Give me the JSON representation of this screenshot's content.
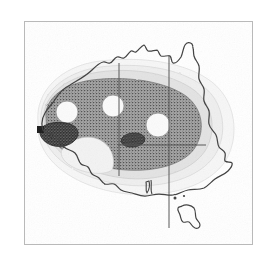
{
  "figure": {
    "title": "Distribution map of Australia",
    "frame": {
      "present": true,
      "color": "#b9b9b9",
      "x": 24,
      "y": 21,
      "w": 229,
      "h": 224
    },
    "background_color": "#ffffff",
    "rendering": "scanned halftone / stippled grayscale print"
  },
  "chart_data": {
    "type": "heatmap",
    "title": "Distribution map of Australia",
    "subtitle": "",
    "xlabel": "",
    "ylabel": "",
    "projection": "Australia outline map",
    "grid": true,
    "legend": "none",
    "legend_position": "none",
    "region_outline": "Australia mainland and Tasmania",
    "density_levels": [
      {
        "name": "outermost-band",
        "label": "lowest density",
        "color": "#f4f4f4",
        "rank": 1
      },
      {
        "name": "outer-band",
        "label": "low density",
        "color": "#e8e8e8",
        "rank": 2
      },
      {
        "name": "mid-band",
        "label": "moderate density",
        "color": "#d4d4d4",
        "rank": 3
      },
      {
        "name": "core-band",
        "label": "high density (stippled)",
        "color": "#8f8f8f",
        "rank": 4
      },
      {
        "name": "hotspot",
        "label": "maximum density",
        "color": "#4a4a4a",
        "rank": 5
      },
      {
        "name": "void",
        "label": "no data / gap",
        "color": "#fbfbfb",
        "rank": 0
      }
    ],
    "voids": [
      {
        "name": "void-west",
        "cx": 67,
        "cy": 112,
        "rx": 11,
        "ry": 11
      },
      {
        "name": "void-central-north",
        "cx": 113,
        "cy": 106,
        "rx": 11,
        "ry": 11
      },
      {
        "name": "void-east",
        "cx": 158,
        "cy": 125,
        "rx": 12,
        "ry": 12
      }
    ],
    "hotspots": [
      {
        "name": "hotspot-west-crescent",
        "cx": 60,
        "cy": 134,
        "rx": 19,
        "ry": 10
      },
      {
        "name": "hotspot-central",
        "cx": 133,
        "cy": 140,
        "rx": 12,
        "ry": 7
      }
    ],
    "graticule": {
      "meridians": [
        119,
        169
      ],
      "parallels": [
        145
      ]
    }
  },
  "map": {
    "grid_line_color": "#5a5a5a",
    "coastline_color": "#4a4a4a",
    "islands": [
      "Mainland Australia",
      "Tasmania"
    ]
  },
  "icons": {
    "map_icon": "map-icon"
  }
}
